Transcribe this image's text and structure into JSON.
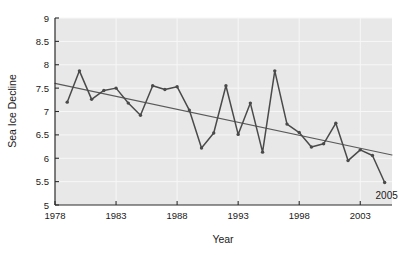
{
  "chart_data": {
    "type": "line",
    "title": "",
    "xlabel": "Year",
    "ylabel": "Sea Ice Decline",
    "xlim": [
      1978,
      2005.6
    ],
    "ylim": [
      5,
      9
    ],
    "grid": true,
    "legend": null,
    "xticks": [
      1978,
      1983,
      1988,
      1993,
      1998,
      2003
    ],
    "xtick_labels": [
      "1978",
      "1983",
      "1988",
      "1993",
      "1998",
      "2003"
    ],
    "yticks": [
      5,
      5.5,
      6,
      6.5,
      7,
      7.5,
      8,
      8.5,
      9
    ],
    "ytick_labels": [
      "5",
      "5.5",
      "6",
      "6.5",
      "7",
      "7.5",
      "8",
      "8.5",
      "9"
    ],
    "x": [
      1979,
      1980,
      1981,
      1982,
      1983,
      1984,
      1985,
      1986,
      1987,
      1988,
      1989,
      1990,
      1991,
      1992,
      1993,
      1994,
      1995,
      1996,
      1997,
      1998,
      1999,
      2000,
      2001,
      2002,
      2003,
      2004,
      2005
    ],
    "values": [
      7.2,
      7.87,
      7.26,
      7.45,
      7.5,
      7.18,
      6.92,
      7.55,
      7.47,
      7.53,
      7.03,
      6.22,
      6.54,
      7.55,
      6.51,
      7.18,
      6.13,
      7.87,
      6.73,
      6.55,
      6.24,
      6.31,
      6.75,
      5.95,
      6.18,
      6.06,
      5.48
    ],
    "series": [
      {
        "name": "Sea Ice Decline",
        "style": "line-with-markers",
        "color": "#4a4a4a",
        "values": [
          7.2,
          7.87,
          7.26,
          7.45,
          7.5,
          7.18,
          6.92,
          7.55,
          7.47,
          7.53,
          7.03,
          6.22,
          6.54,
          7.55,
          6.51,
          7.18,
          6.13,
          7.87,
          6.73,
          6.55,
          6.24,
          6.31,
          6.75,
          5.95,
          6.18,
          6.06,
          5.48
        ]
      },
      {
        "name": "Linear trend",
        "style": "line",
        "color": "#5a5a5a",
        "x": [
          1978,
          2005.6
        ],
        "values": [
          7.6,
          6.07
        ]
      }
    ],
    "annotations": [
      {
        "text": "2005",
        "x": 2005,
        "y": 5.48
      }
    ],
    "plot_background": "#e8e8e8",
    "gridline_color": "#f7f7f7",
    "axis_color": "#2a2a2a"
  }
}
